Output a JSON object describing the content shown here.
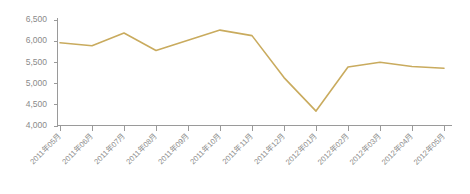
{
  "chart_data": {
    "type": "line",
    "title": "",
    "subtitle": "",
    "xlabel": "",
    "ylabel": "",
    "categories": [
      "2011年05月",
      "2011年06月",
      "2011年07月",
      "2011年08月",
      "2011年09月",
      "2011年10月",
      "2011年11月",
      "2011年12月",
      "2012年01月",
      "2012年02月",
      "2012年03月",
      "2012年04月",
      "2012年05月"
    ],
    "values": [
      5950,
      5880,
      6180,
      5770,
      6010,
      6250,
      6120,
      5130,
      4340,
      5380,
      5490,
      5390,
      5350
    ],
    "series": [
      {
        "name": "series-1",
        "color": "#c9ab5e",
        "values": [
          5950,
          5880,
          6180,
          5770,
          6010,
          6250,
          6120,
          5130,
          4340,
          5380,
          5490,
          5390,
          5350
        ]
      }
    ],
    "ylim": [
      4000,
      6500
    ],
    "ytick_values": [
      4000,
      4500,
      5000,
      5500,
      6000,
      6500
    ],
    "ytick_labels": [
      "4,000",
      "4,500",
      "5,000",
      "5,500",
      "6,000",
      "6,500"
    ],
    "grid": false,
    "legend": false,
    "legend_position": "none",
    "xtick_rotation": -45,
    "axis_color": "#9a9a9a",
    "tick_label_color": "#8a8a8a",
    "background_color": "#ffffff"
  }
}
